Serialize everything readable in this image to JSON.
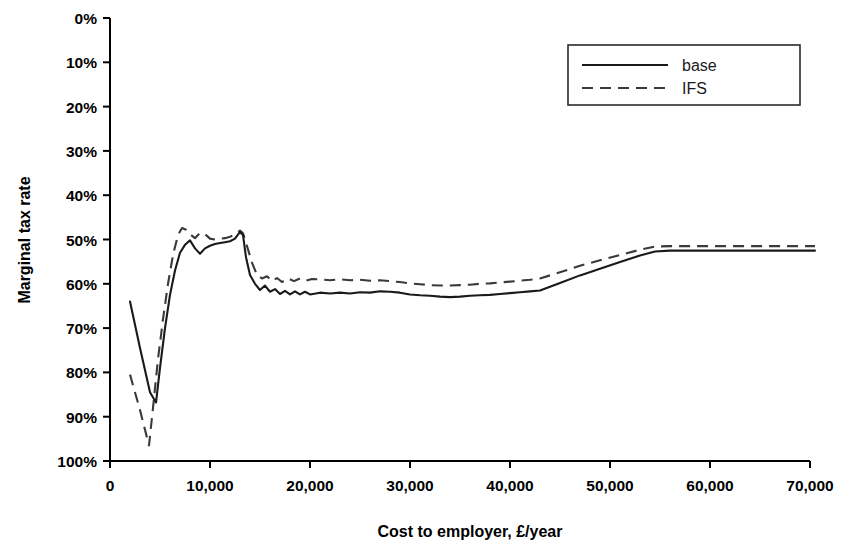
{
  "chart_data": {
    "type": "line",
    "title": "",
    "xlabel": "Cost to employer, £/year",
    "ylabel": "Marginal tax rate",
    "xlim": [
      0,
      70000
    ],
    "ylim": [
      0,
      1.0
    ],
    "grid": false,
    "legend_position": "top-right",
    "x_tick_labels": [
      "0",
      "10,000",
      "20,000",
      "30,000",
      "40,000",
      "50,000",
      "60,000",
      "70,000"
    ],
    "x_tick_values": [
      0,
      10000,
      20000,
      30000,
      40000,
      50000,
      60000,
      70000
    ],
    "y_tick_labels": [
      "0%",
      "10%",
      "20%",
      "30%",
      "40%",
      "50%",
      "60%",
      "70%",
      "80%",
      "90%",
      "100%"
    ],
    "y_tick_values": [
      0,
      10,
      20,
      30,
      40,
      50,
      60,
      70,
      80,
      90,
      100
    ],
    "series": [
      {
        "name": "base",
        "style": "solid",
        "color": "#1a1a1a",
        "x": [
          2000,
          3000,
          4000,
          4600,
          5000,
          5500,
          6000,
          6500,
          7000,
          7500,
          8000,
          8500,
          9000,
          9500,
          10000,
          10500,
          11000,
          11500,
          12000,
          12500,
          13000,
          13300,
          13600,
          14000,
          14500,
          15000,
          15500,
          16000,
          16500,
          17000,
          17500,
          18000,
          18500,
          19000,
          19500,
          20000,
          21000,
          22000,
          23000,
          24000,
          25000,
          26000,
          27000,
          28000,
          29000,
          30000,
          31000,
          32000,
          33000,
          34000,
          35000,
          36000,
          37000,
          38000,
          39000,
          40000,
          41000,
          42000,
          43000,
          45000,
          47000,
          49000,
          51000,
          53000,
          54500,
          56000,
          58000,
          60000,
          63000,
          66000,
          70500
        ],
        "y": [
          36.0,
          25.5,
          15.5,
          13.2,
          21.0,
          30.0,
          37.5,
          43.0,
          47.0,
          48.8,
          49.8,
          48.0,
          46.8,
          48.0,
          48.6,
          49.0,
          49.2,
          49.4,
          49.6,
          50.2,
          51.7,
          51.0,
          46.0,
          42.0,
          40.0,
          38.6,
          39.6,
          38.2,
          38.8,
          37.7,
          38.4,
          37.6,
          38.3,
          37.6,
          38.2,
          37.6,
          38.0,
          37.8,
          38.0,
          37.8,
          38.1,
          38.0,
          38.3,
          38.2,
          38.0,
          37.6,
          37.4,
          37.3,
          37.1,
          37.0,
          37.1,
          37.3,
          37.4,
          37.5,
          37.7,
          37.9,
          38.1,
          38.3,
          38.5,
          40.2,
          41.9,
          43.4,
          44.9,
          46.4,
          47.3,
          47.5,
          47.5,
          47.5,
          47.5,
          47.5,
          47.5
        ]
      },
      {
        "name": "IFS",
        "style": "dashed",
        "color": "#3a3a3a",
        "x": [
          2000,
          3000,
          3900,
          4300,
          4800,
          5300,
          5800,
          6300,
          6800,
          7200,
          7600,
          8000,
          8500,
          9000,
          9500,
          10000,
          10500,
          11000,
          11500,
          12000,
          12500,
          13000,
          13300,
          13700,
          14200,
          14700,
          15200,
          15700,
          16200,
          16700,
          17200,
          17800,
          18400,
          19000,
          19600,
          20200,
          21000,
          22000,
          23000,
          24000,
          25000,
          26000,
          27000,
          28000,
          29000,
          30000,
          31000,
          32000,
          33000,
          34000,
          35000,
          36000,
          37000,
          38000,
          39000,
          40000,
          41000,
          42000,
          43000,
          45000,
          47000,
          49000,
          51000,
          53000,
          54500,
          56000,
          58000,
          60000,
          63000,
          66000,
          70500
        ],
        "y": [
          19.5,
          11.5,
          3.5,
          12.0,
          23.0,
          32.0,
          40.0,
          46.5,
          51.0,
          52.6,
          52.2,
          51.2,
          50.3,
          51.5,
          51.2,
          50.2,
          50.0,
          50.2,
          50.3,
          50.6,
          51.2,
          52.0,
          51.4,
          48.5,
          44.8,
          42.0,
          41.2,
          41.7,
          40.6,
          41.3,
          40.4,
          41.2,
          40.6,
          41.2,
          40.7,
          41.1,
          41.0,
          40.8,
          41.0,
          40.8,
          40.9,
          40.7,
          40.8,
          40.6,
          40.4,
          40.1,
          39.9,
          39.7,
          39.6,
          39.6,
          39.7,
          39.8,
          40.0,
          40.1,
          40.3,
          40.5,
          40.7,
          40.9,
          41.2,
          42.6,
          44.1,
          45.3,
          46.5,
          47.7,
          48.4,
          48.5,
          48.5,
          48.5,
          48.5,
          48.5,
          48.5
        ]
      }
    ],
    "legend_entries": [
      {
        "label": "base",
        "style": "solid"
      },
      {
        "label": "IFS",
        "style": "dashed"
      }
    ]
  },
  "axes": {
    "y_title": "Marginal tax rate",
    "x_title": "Cost to employer, £/year",
    "y_labels": [
      "100%",
      "90%",
      "80%",
      "70%",
      "60%",
      "50%",
      "40%",
      "30%",
      "20%",
      "10%",
      "0%"
    ],
    "x_labels": [
      "0",
      "10,000",
      "20,000",
      "30,000",
      "40,000",
      "50,000",
      "60,000",
      "70,000"
    ]
  },
  "legend": {
    "base_label": "base",
    "ifs_label": "IFS"
  }
}
